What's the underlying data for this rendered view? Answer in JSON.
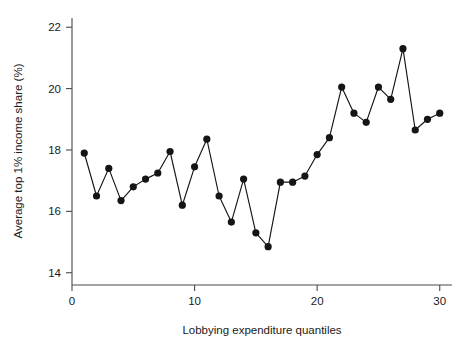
{
  "chart_data": {
    "type": "line",
    "title": "",
    "subtitle": "",
    "xlabel": "Lobbying expenditure quantiles",
    "ylabel": "Average top 1% income share (%)",
    "xlim": [
      0,
      31
    ],
    "ylim": [
      13.6,
      22.3
    ],
    "xticks": [
      0,
      10,
      20,
      30
    ],
    "xtick_labels": [
      "0",
      "10",
      "20",
      "30"
    ],
    "yticks": [
      14,
      16,
      18,
      20,
      22
    ],
    "ytick_labels": [
      "14",
      "16",
      "18",
      "20",
      "22"
    ],
    "grid": false,
    "legend": null,
    "legend_position": "none",
    "marker": "filled-circle",
    "marker_color": "#151515",
    "line_color": "#151515",
    "x": [
      1,
      2,
      3,
      4,
      5,
      6,
      7,
      8,
      9,
      10,
      11,
      12,
      13,
      14,
      15,
      16,
      17,
      18,
      19,
      20,
      21,
      22,
      23,
      24,
      25,
      26,
      27,
      28,
      29,
      30
    ],
    "y": [
      17.9,
      16.5,
      17.4,
      16.35,
      16.8,
      17.05,
      17.25,
      17.95,
      16.2,
      17.45,
      18.35,
      16.5,
      15.65,
      17.05,
      15.3,
      14.85,
      16.95,
      16.95,
      17.15,
      17.85,
      18.4,
      20.05,
      19.2,
      18.9,
      20.05,
      19.65,
      21.3,
      18.65,
      19.0,
      19.2
    ],
    "series": [
      {
        "name": "Average top 1% income share",
        "x": [
          1,
          2,
          3,
          4,
          5,
          6,
          7,
          8,
          9,
          10,
          11,
          12,
          13,
          14,
          15,
          16,
          17,
          18,
          19,
          20,
          21,
          22,
          23,
          24,
          25,
          26,
          27,
          28,
          29,
          30
        ],
        "values": [
          17.9,
          16.5,
          17.4,
          16.35,
          16.8,
          17.05,
          17.25,
          17.95,
          16.2,
          17.45,
          18.35,
          16.5,
          15.65,
          17.05,
          15.3,
          14.85,
          16.95,
          16.95,
          17.15,
          17.85,
          18.4,
          20.05,
          19.2,
          18.9,
          20.05,
          19.65,
          21.3,
          18.65,
          19.0,
          19.2
        ]
      }
    ],
    "annotations": []
  },
  "figure": {
    "background_color": "#ffffff",
    "axis_color": "#4a4a4a",
    "text_color": "#1a1a1a"
  }
}
